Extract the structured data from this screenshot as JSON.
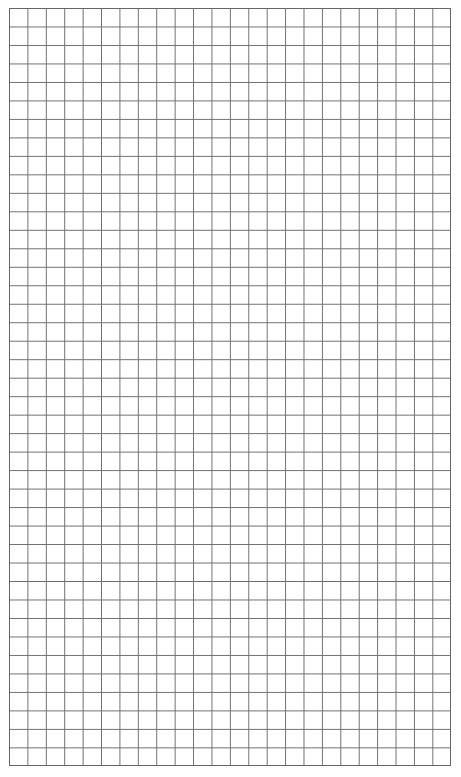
{
  "page": {
    "type": "graph-paper",
    "title": ""
  },
  "grid": {
    "columns": 24,
    "rows": 41,
    "line_color": "#6e6e6e",
    "background_color": "#ffffff"
  }
}
